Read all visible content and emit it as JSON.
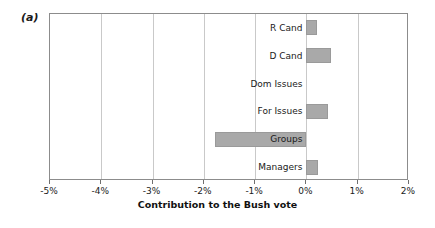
{
  "figure": {
    "panel_label": "(a)",
    "bar_color": "#a9a9a9",
    "frame_color": "#8c8c8c",
    "grid_color": "#c9c9c9"
  },
  "chart_data": {
    "type": "bar",
    "orientation": "horizontal",
    "title": "",
    "subtitle": "",
    "xlabel": "Contribution to the Bush vote",
    "ylabel": "",
    "categories": [
      "R Cand",
      "D Cand",
      "Dom Issues",
      "For Issues",
      "Groups",
      "Managers"
    ],
    "values": [
      0.2,
      0.47,
      0.0,
      0.42,
      -1.78,
      0.22
    ],
    "unit": "%",
    "xlim": [
      -5,
      2
    ],
    "xticks": [
      -5,
      -4,
      -3,
      -2,
      -1,
      0,
      1,
      2
    ],
    "xticklabels": [
      "-5%",
      "-4%",
      "-3%",
      "-2%",
      "-1%",
      "0%",
      "1%",
      "2%"
    ],
    "grid": "vertical",
    "legend": null,
    "annotations": [
      "(a)"
    ]
  }
}
